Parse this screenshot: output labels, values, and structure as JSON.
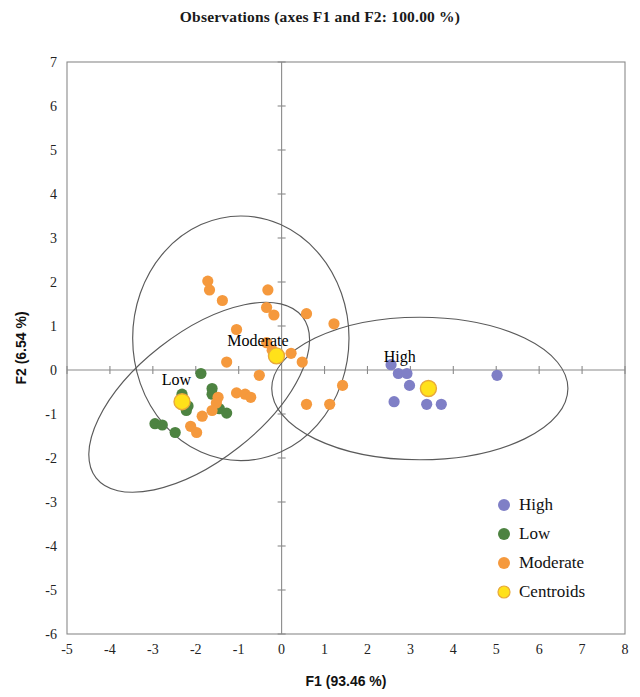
{
  "chart_data": {
    "type": "scatter",
    "title": "Observations (axes F1 and F2: 100.00 %)",
    "xlabel": "F1 (93.46 %)",
    "ylabel": "F2 (6.54 %)",
    "xlim": [
      -5,
      8
    ],
    "ylim": [
      -6,
      7
    ],
    "xticks": [
      "-5",
      "-4",
      "-3",
      "-2",
      "-1",
      "0",
      "1",
      "2",
      "3",
      "4",
      "5",
      "6",
      "7",
      "8"
    ],
    "yticks": [
      "7",
      "6",
      "5",
      "4",
      "3",
      "2",
      "1",
      "0",
      "-1",
      "-2",
      "-3",
      "-4",
      "-5",
      "-6"
    ],
    "grid": false,
    "legend_position": "bottom-right",
    "annotations": [
      {
        "text": "Moderate",
        "x": -0.55,
        "y": 0.55
      },
      {
        "text": "Low",
        "x": -2.45,
        "y": -0.35
      },
      {
        "text": "High",
        "x": 2.75,
        "y": 0.18
      }
    ],
    "series": [
      {
        "name": "High",
        "color": "#7f7fc6",
        "points": [
          {
            "x": 2.55,
            "y": 0.12
          },
          {
            "x": 2.72,
            "y": -0.08
          },
          {
            "x": 2.92,
            "y": -0.08
          },
          {
            "x": 2.98,
            "y": -0.35
          },
          {
            "x": 2.62,
            "y": -0.72
          },
          {
            "x": 3.38,
            "y": -0.78
          },
          {
            "x": 3.72,
            "y": -0.78
          },
          {
            "x": 5.02,
            "y": -0.12
          }
        ]
      },
      {
        "name": "Low",
        "color": "#4d8341",
        "points": [
          {
            "x": -1.88,
            "y": -0.08
          },
          {
            "x": -1.62,
            "y": -0.42
          },
          {
            "x": -1.62,
            "y": -0.55
          },
          {
            "x": -2.32,
            "y": -0.55
          },
          {
            "x": -2.18,
            "y": -0.82
          },
          {
            "x": -2.22,
            "y": -0.92
          },
          {
            "x": -1.45,
            "y": -0.88
          },
          {
            "x": -1.28,
            "y": -0.98
          },
          {
            "x": -2.95,
            "y": -1.22
          },
          {
            "x": -2.78,
            "y": -1.25
          },
          {
            "x": -2.48,
            "y": -1.42
          }
        ]
      },
      {
        "name": "Moderate",
        "color": "#f5993d",
        "points": [
          {
            "x": -1.72,
            "y": 2.02
          },
          {
            "x": -1.68,
            "y": 1.82
          },
          {
            "x": -1.38,
            "y": 1.58
          },
          {
            "x": -0.32,
            "y": 1.82
          },
          {
            "x": -0.35,
            "y": 1.42
          },
          {
            "x": -0.18,
            "y": 1.25
          },
          {
            "x": 0.58,
            "y": 1.28
          },
          {
            "x": 1.22,
            "y": 1.05
          },
          {
            "x": -1.05,
            "y": 0.92
          },
          {
            "x": -0.35,
            "y": 0.62
          },
          {
            "x": -0.22,
            "y": 0.45
          },
          {
            "x": 0.22,
            "y": 0.38
          },
          {
            "x": 0.48,
            "y": 0.18
          },
          {
            "x": -1.28,
            "y": 0.18
          },
          {
            "x": -0.52,
            "y": -0.12
          },
          {
            "x": -1.05,
            "y": -0.52
          },
          {
            "x": -0.85,
            "y": -0.55
          },
          {
            "x": -0.72,
            "y": -0.62
          },
          {
            "x": -1.48,
            "y": -0.62
          },
          {
            "x": -1.52,
            "y": -0.75
          },
          {
            "x": -1.62,
            "y": -0.92
          },
          {
            "x": -1.85,
            "y": -1.05
          },
          {
            "x": -2.12,
            "y": -1.28
          },
          {
            "x": -1.98,
            "y": -1.42
          },
          {
            "x": 0.58,
            "y": -0.78
          },
          {
            "x": 1.12,
            "y": -0.78
          },
          {
            "x": 1.42,
            "y": -0.35
          }
        ]
      },
      {
        "name": "Centroids",
        "color": "#ffe11a",
        "points": [
          {
            "x": -0.12,
            "y": 0.32
          },
          {
            "x": -2.32,
            "y": -0.72
          },
          {
            "x": 3.42,
            "y": -0.42
          }
        ]
      }
    ],
    "ellipses": [
      {
        "cx": -0.95,
        "cy": 0.72,
        "rx": 2.52,
        "ry": 2.78,
        "rot": 0,
        "for": "Moderate"
      },
      {
        "cx": -1.92,
        "cy": -0.62,
        "rx": 3.05,
        "ry": 1.45,
        "rot": -38,
        "for": "Low"
      },
      {
        "cx": 3.22,
        "cy": -0.42,
        "rx": 3.45,
        "ry": 1.62,
        "rot": 0,
        "for": "High"
      }
    ]
  },
  "legend": {
    "items": [
      {
        "label": "High",
        "color": "#7f7fc6"
      },
      {
        "label": "Low",
        "color": "#4d8341"
      },
      {
        "label": "Moderate",
        "color": "#f5993d"
      },
      {
        "label": "Centroids",
        "color": "#ffe11a"
      }
    ]
  }
}
